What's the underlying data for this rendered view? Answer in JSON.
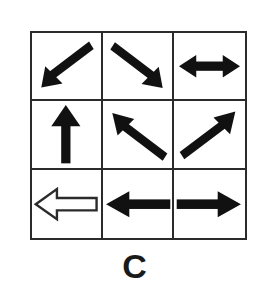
{
  "figure": {
    "label": "C",
    "grid": {
      "rows": 3,
      "cols": 3,
      "border_color": "#2b2b2b",
      "background_color": "#ffffff"
    },
    "cells": [
      {
        "position": "row1-col1",
        "icon_name": "arrow-down-left-icon",
        "direction": "down-left",
        "heads": 1,
        "style": "filled",
        "fill_color": "#111111",
        "description": "solid black arrow pointing down-left"
      },
      {
        "position": "row1-col2",
        "icon_name": "arrow-down-right-icon",
        "direction": "down-right",
        "heads": 1,
        "style": "filled",
        "fill_color": "#111111",
        "description": "solid black arrow pointing down-right"
      },
      {
        "position": "row1-col3",
        "icon_name": "arrow-left-right-icon",
        "direction": "left-right",
        "heads": 2,
        "style": "filled",
        "fill_color": "#111111",
        "description": "solid black double-headed horizontal arrow"
      },
      {
        "position": "row2-col1",
        "icon_name": "arrow-up-icon",
        "direction": "up",
        "heads": 1,
        "style": "filled",
        "fill_color": "#111111",
        "description": "solid black arrow pointing up"
      },
      {
        "position": "row2-col2",
        "icon_name": "arrow-up-left-icon",
        "direction": "up-left",
        "heads": 1,
        "style": "filled",
        "fill_color": "#111111",
        "description": "solid black arrow pointing up-left"
      },
      {
        "position": "row2-col3",
        "icon_name": "arrow-up-right-icon",
        "direction": "up-right",
        "heads": 1,
        "style": "filled",
        "fill_color": "#111111",
        "description": "solid black arrow pointing up-right"
      },
      {
        "position": "row3-col1",
        "icon_name": "arrow-left-outline-icon",
        "direction": "left",
        "heads": 1,
        "style": "outline",
        "fill_color": "#ffffff",
        "stroke_color": "#2b2b2b",
        "description": "white outlined arrow pointing left"
      },
      {
        "position": "row3-col2",
        "icon_name": "arrow-left-icon",
        "direction": "left",
        "heads": 1,
        "style": "filled",
        "fill_color": "#111111",
        "description": "solid black arrow pointing left"
      },
      {
        "position": "row3-col3",
        "icon_name": "arrow-right-icon",
        "direction": "right",
        "heads": 1,
        "style": "filled",
        "fill_color": "#111111",
        "description": "solid black arrow pointing right"
      }
    ]
  }
}
